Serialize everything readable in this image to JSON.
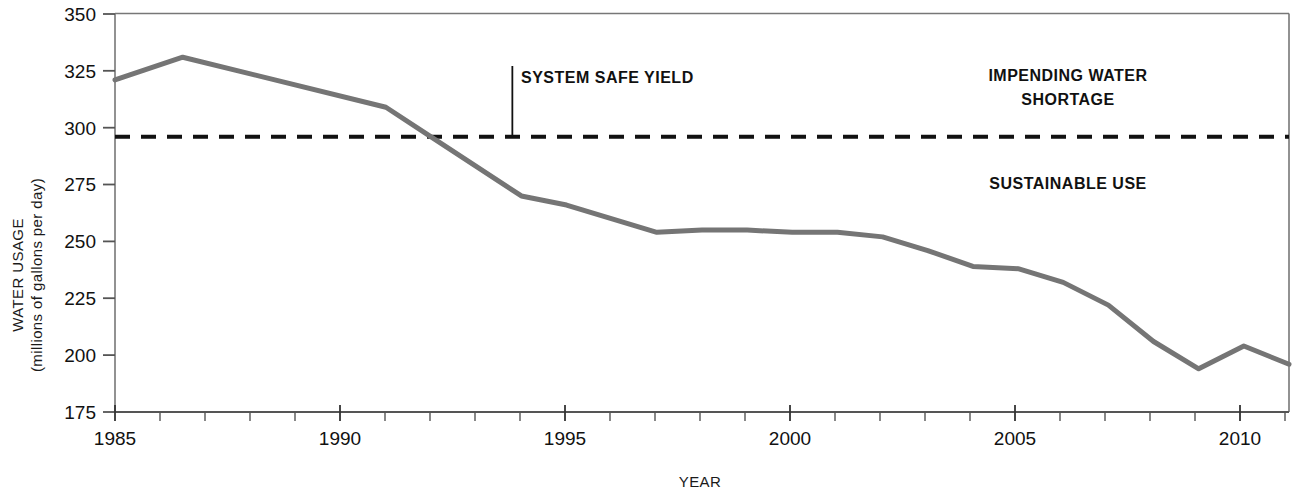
{
  "chart_data": {
    "type": "line",
    "title": "",
    "xlabel": "YEAR",
    "ylabel": "WATER USAGE (millions of gallons per day)",
    "ylabel_line1": "WATER USAGE",
    "ylabel_line2": "(millions of gallons per day)",
    "xlim": [
      1985,
      2011
    ],
    "ylim": [
      175,
      350
    ],
    "y_ticks": [
      175,
      200,
      225,
      250,
      275,
      300,
      325,
      350
    ],
    "y_tick_labels": [
      "175",
      "200",
      "225",
      "250",
      "275",
      "300",
      "325",
      "350"
    ],
    "x_ticks": [
      1985,
      1990,
      1995,
      2000,
      2005,
      2010
    ],
    "x_tick_labels": [
      "1985",
      "1990",
      "1995",
      "2000",
      "2005",
      "2010"
    ],
    "x_minor_tick_step": 1,
    "grid": false,
    "legend": "none",
    "line_color": "#757575",
    "line_width": 5,
    "series": [
      {
        "name": "Water usage",
        "x": [
          1985,
          1986.5,
          1991,
          1992,
          1994,
          1995,
          1997,
          1998,
          1999,
          2000,
          2001,
          2002,
          2003,
          2004,
          2005,
          2006,
          2007,
          2008,
          2009,
          2010,
          2011
        ],
        "values": [
          321,
          331,
          309,
          296,
          270,
          266,
          254,
          255,
          255,
          254,
          254,
          252,
          246,
          239,
          238,
          232,
          222,
          206,
          194,
          204,
          196
        ]
      }
    ],
    "threshold_line": {
      "label": "SYSTEM SAFE YIELD",
      "value": 296,
      "style": "dashed",
      "color": "#111111",
      "leader_x": 1993.8
    },
    "region_labels": [
      {
        "text_line1": "IMPENDING WATER",
        "text_line2": "SHORTAGE",
        "x": 2007.6,
        "y": 318
      },
      {
        "text_line1": "SUSTAINABLE USE",
        "text_line2": "",
        "x": 2007.6,
        "y": 277
      }
    ]
  }
}
